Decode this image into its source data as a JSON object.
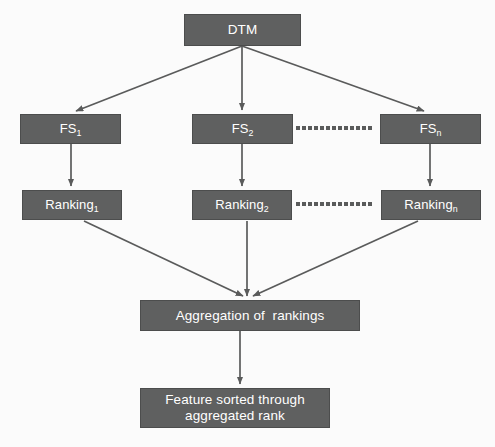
{
  "diagram": {
    "background_color": "#fbfbfb",
    "node_fill_color": "#5f6060",
    "node_text_color": "#ffffff",
    "edge_color": "#5a5b5b",
    "nodes": {
      "dtm": {
        "label": "DTM"
      },
      "fs1": {
        "base": "FS",
        "sub": "1"
      },
      "fs2": {
        "base": "FS",
        "sub": "2"
      },
      "fsn": {
        "base": "FS",
        "sub": "n"
      },
      "ranking1": {
        "base": "Ranking",
        "sub": "1"
      },
      "ranking2": {
        "base": "Ranking",
        "sub": "2"
      },
      "rankingn": {
        "base": "Ranking",
        "sub": "n"
      },
      "aggregation": {
        "label": "Aggregation of  rankings"
      },
      "output": {
        "line1": "Feature sorted through",
        "line2": "aggregated rank"
      }
    },
    "ellipsis": {
      "fs_row_dots": 13,
      "ranking_row_dots": 13
    },
    "edges": [
      {
        "from": "dtm",
        "to": "fs1",
        "style": "solid-arrow"
      },
      {
        "from": "dtm",
        "to": "fs2",
        "style": "solid-arrow"
      },
      {
        "from": "dtm",
        "to": "fsn",
        "style": "solid-arrow"
      },
      {
        "from": "fs1",
        "to": "ranking1",
        "style": "solid-arrow"
      },
      {
        "from": "fs2",
        "to": "ranking2",
        "style": "solid-arrow"
      },
      {
        "from": "fsn",
        "to": "rankingn",
        "style": "solid-arrow"
      },
      {
        "from": "fs2",
        "to": "fsn",
        "style": "dotted"
      },
      {
        "from": "ranking2",
        "to": "rankingn",
        "style": "dotted"
      },
      {
        "from": "ranking1",
        "to": "aggregation",
        "style": "solid-arrow"
      },
      {
        "from": "ranking2",
        "to": "aggregation",
        "style": "solid-arrow"
      },
      {
        "from": "rankingn",
        "to": "aggregation",
        "style": "solid-arrow"
      },
      {
        "from": "aggregation",
        "to": "output",
        "style": "solid-arrow"
      }
    ]
  }
}
